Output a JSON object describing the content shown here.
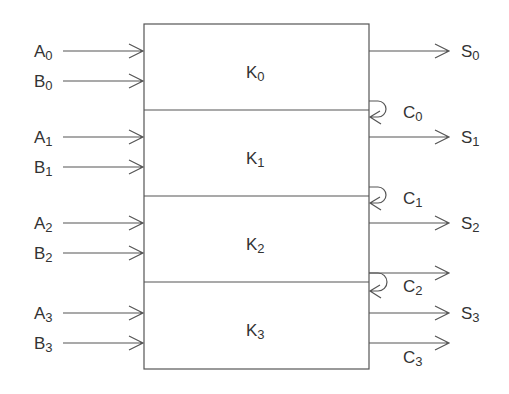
{
  "diagram": {
    "type": "4-bit ripple-carry adder block diagram",
    "blocks": [
      {
        "label": "K",
        "sub": "0"
      },
      {
        "label": "K",
        "sub": "1"
      },
      {
        "label": "K",
        "sub": "2"
      },
      {
        "label": "K",
        "sub": "3"
      }
    ],
    "inputs": [
      {
        "a": "A",
        "b": "B",
        "sub": "0"
      },
      {
        "a": "A",
        "b": "B",
        "sub": "1"
      },
      {
        "a": "A",
        "b": "B",
        "sub": "2"
      },
      {
        "a": "A",
        "b": "B",
        "sub": "3"
      }
    ],
    "sums": [
      {
        "label": "S",
        "sub": "0"
      },
      {
        "label": "S",
        "sub": "1"
      },
      {
        "label": "S",
        "sub": "2"
      },
      {
        "label": "S",
        "sub": "3"
      }
    ],
    "carries": [
      {
        "label": "C",
        "sub": "0"
      },
      {
        "label": "C",
        "sub": "1"
      },
      {
        "label": "C",
        "sub": "2"
      },
      {
        "label": "C",
        "sub": "3"
      }
    ],
    "colors": {
      "line": "#555555",
      "text": "#333333",
      "background": "#ffffff"
    }
  }
}
